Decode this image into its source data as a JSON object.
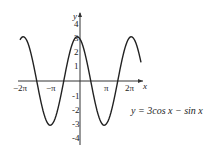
{
  "chart_data": {
    "type": "line",
    "title": "",
    "function": "y = 3cos x − sin x",
    "annotation": "y = 3cos x − sin x",
    "xlabel": "x",
    "ylabel": "y",
    "xlim": [
      -7.0,
      7.6
    ],
    "ylim": [
      -4.6,
      4.6
    ],
    "x_ticks": [
      "−2π",
      "−π",
      "π",
      "2π"
    ],
    "y_ticks": [
      "4",
      "3",
      "2",
      "1",
      "-1",
      "-2",
      "-3",
      "-4"
    ],
    "series": [
      {
        "name": "y = 3cos x − sin x",
        "amplitude": 3.162,
        "phase": 0.3218
      }
    ],
    "grid": false,
    "colors": {
      "curve": "#222222",
      "axis": "#333333"
    }
  },
  "labels": {
    "x_axis": "x",
    "y_axis": "y",
    "xt": [
      "−2π",
      "−π",
      "π",
      "2π"
    ],
    "yt": [
      "4",
      "3",
      "2",
      "1",
      "-1",
      "-2",
      "-3",
      "-4"
    ]
  }
}
